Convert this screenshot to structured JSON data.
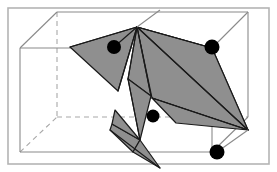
{
  "figure": {
    "title": "3D bounding box with shaded polyhedral surface patches and four marked vertices",
    "width": 277,
    "height": 172,
    "background_color": "#ffffff",
    "frame": {
      "label": "outer-border-frame",
      "x": 8,
      "y": 8,
      "width": 261,
      "height": 156,
      "stroke_color": "#b4b4b4",
      "stroke_width": 1.6,
      "fill": "none"
    },
    "colors": {
      "facet_fill": "#8f8f8f",
      "facet_fill_light": "#9a9a9a",
      "facet_stroke": "#1a1a1a",
      "box_solid_edge": "#8a8a8a",
      "box_hidden_edge": "#a8a8a8",
      "marker_fill": "#000000",
      "frame_stroke": "#b4b4b4",
      "background": "#ffffff"
    },
    "box": {
      "label": "wireframe-bounding-box",
      "solid_edge_width": 1.1,
      "hidden_edge_width": 1.1,
      "hidden_dash_pattern": "5,4",
      "vertices": {
        "back_top_left": [
          20,
          48
        ],
        "back_top_right": [
          212,
          48
        ],
        "back_bottom_left": [
          20,
          152
        ],
        "back_bottom_right": [
          212,
          152
        ],
        "front_top_left": [
          57,
          12
        ],
        "front_top_right": [
          248,
          12
        ],
        "front_bottom_left": [
          57,
          117
        ],
        "front_bottom_right": [
          248,
          117
        ]
      },
      "solid_edges": [
        {
          "name": "edge-back-top",
          "from": [
            20,
            48
          ],
          "to": [
            212,
            48
          ]
        },
        {
          "name": "edge-back-left-vertical",
          "from": [
            20,
            48
          ],
          "to": [
            20,
            152
          ]
        },
        {
          "name": "edge-back-bottom",
          "from": [
            20,
            152
          ],
          "to": [
            212,
            152
          ]
        },
        {
          "name": "edge-back-right-vertical",
          "from": [
            212,
            48
          ],
          "to": [
            212,
            152
          ]
        },
        {
          "name": "edge-front-top",
          "from": [
            57,
            12
          ],
          "to": [
            248,
            12
          ]
        },
        {
          "name": "edge-front-right-vertical",
          "from": [
            248,
            12
          ],
          "to": [
            248,
            117
          ]
        },
        {
          "name": "edge-diagonal-top-left",
          "from": [
            20,
            48
          ],
          "to": [
            57,
            12
          ]
        },
        {
          "name": "edge-diagonal-top-right",
          "from": [
            212,
            48
          ],
          "to": [
            248,
            12
          ]
        },
        {
          "name": "edge-diagonal-bottom-right",
          "from": [
            212,
            152
          ],
          "to": [
            248,
            117
          ]
        }
      ],
      "hidden_edges": [
        {
          "name": "hidden-edge-front-left-vertical",
          "from": [
            57,
            12
          ],
          "to": [
            57,
            117
          ]
        },
        {
          "name": "hidden-edge-front-bottom",
          "from": [
            57,
            117
          ],
          "to": [
            248,
            117
          ]
        },
        {
          "name": "hidden-edge-diagonal-bottom-left",
          "from": [
            20,
            152
          ],
          "to": [
            57,
            117
          ]
        }
      ]
    },
    "facets": [
      {
        "name": "facet-left-wing",
        "points": "137,27 70,47 118,91",
        "shade": "#8f8f8f"
      },
      {
        "name": "facet-right-main-quad",
        "points": "137,27 212,48 248,130 152,98",
        "shade": "#8f8f8f"
      },
      {
        "name": "facet-right-upper-sliver",
        "points": "137,27 248,130 212,48",
        "shade": "#8f8f8f"
      },
      {
        "name": "facet-right-lower-blade",
        "points": "152,98 248,130 176,123",
        "shade": "#8f8f8f"
      },
      {
        "name": "facet-center-upper-sliver",
        "points": "137,27 151,96 128,79",
        "shade": "#8f8f8f"
      },
      {
        "name": "facet-center-spine",
        "points": "128,79 151,96 140,140",
        "shade": "#8f8f8f"
      },
      {
        "name": "facet-center-lower-left",
        "points": "115,110 140,140 112,124",
        "shade": "#8f8f8f"
      },
      {
        "name": "facet-center-lower-tail",
        "points": "140,140 160,168 133,152",
        "shade": "#8f8f8f"
      },
      {
        "name": "facet-center-narrow-strip",
        "points": "112,124 140,140 133,152 110,130",
        "shade": "#8f8f8f"
      }
    ],
    "connector_lines": [
      {
        "name": "line-apex-to-left-marker",
        "from": [
          137,
          27
        ],
        "to": [
          114,
          47
        ]
      },
      {
        "name": "line-apex-to-left-edge",
        "from": [
          137,
          27
        ],
        "to": [
          70,
          47
        ]
      },
      {
        "name": "line-apex-to-lower-left",
        "from": [
          137,
          27
        ],
        "to": [
          118,
          91
        ]
      },
      {
        "name": "line-apex-to-center",
        "from": [
          137,
          27
        ],
        "to": [
          128,
          79
        ]
      },
      {
        "name": "line-apex-to-center-b",
        "from": [
          137,
          27
        ],
        "to": [
          151,
          96
        ]
      },
      {
        "name": "line-apex-to-right-corner",
        "from": [
          137,
          27
        ],
        "to": [
          212,
          48
        ]
      },
      {
        "name": "line-apex-to-front-bottom-right",
        "from": [
          137,
          27
        ],
        "to": [
          248,
          130
        ]
      },
      {
        "name": "line-apex-up-to-front-top",
        "from": [
          137,
          27
        ],
        "to": [
          160,
          10
        ]
      },
      {
        "name": "line-marker-right-down",
        "from": [
          212,
          48
        ],
        "to": [
          212,
          152
        ]
      },
      {
        "name": "line-bottom-right-to-marker",
        "from": [
          248,
          130
        ],
        "to": [
          217,
          152
        ]
      },
      {
        "name": "line-center-to-bottom-right",
        "from": [
          152,
          98
        ],
        "to": [
          248,
          130
        ]
      },
      {
        "name": "line-center-spine-down",
        "from": [
          128,
          79
        ],
        "to": [
          140,
          140
        ]
      },
      {
        "name": "line-lower-cross",
        "from": [
          110,
          130
        ],
        "to": [
          160,
          168
        ]
      }
    ],
    "markers": [
      {
        "name": "vertex-marker-upper-left",
        "cx": 114,
        "cy": 47,
        "r": 7,
        "fill": "#000000"
      },
      {
        "name": "vertex-marker-upper-right",
        "cx": 212,
        "cy": 47,
        "r": 7.5,
        "fill": "#000000"
      },
      {
        "name": "vertex-marker-center-lower",
        "cx": 153,
        "cy": 116,
        "r": 6.5,
        "fill": "#000000"
      },
      {
        "name": "vertex-marker-bottom-right",
        "cx": 217,
        "cy": 152,
        "r": 7.5,
        "fill": "#000000"
      }
    ]
  }
}
